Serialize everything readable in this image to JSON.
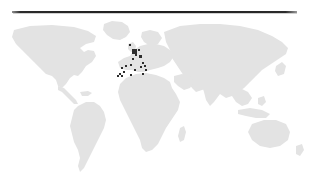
{
  "figure": {
    "background_color": "#ffffff",
    "width": 310,
    "height": 190
  },
  "top_rule": {
    "name": "horizontal-rule",
    "color": "#1d1d1d",
    "x": 12,
    "y": 11,
    "width": 285,
    "thickness": 2
  },
  "map": {
    "projection": "equirectangular",
    "land_color": "#e3e3e3",
    "ocean_color": "#ffffff",
    "x": 0,
    "y": 18,
    "width": 310,
    "height": 162,
    "continents": [
      "North America",
      "South America",
      "Europe",
      "Africa",
      "Asia",
      "Australia",
      "Greenland"
    ]
  },
  "chart_data": {
    "type": "scatter",
    "xlabel": "",
    "ylabel": "",
    "marker_color": "#2d2d2d",
    "marker_shape": "square",
    "region_focus": "Western Europe and North Africa",
    "points": [
      {
        "label": "United Kingdom / Ireland",
        "x": 134,
        "y": 33,
        "size": 5
      },
      {
        "label": "Northern Britain",
        "x": 130,
        "y": 27,
        "size": 2
      },
      {
        "label": "Netherlands / Belgium",
        "x": 139,
        "y": 32,
        "size": 2
      },
      {
        "label": "Germany / Central Europe",
        "x": 140,
        "y": 38,
        "size": 3
      },
      {
        "label": "Northern France",
        "x": 136,
        "y": 37,
        "size": 2
      },
      {
        "label": "Western France",
        "x": 133,
        "y": 41,
        "size": 2
      },
      {
        "label": "Northern Spain",
        "x": 131,
        "y": 47,
        "size": 2
      },
      {
        "label": "Central Iberia",
        "x": 126,
        "y": 48,
        "size": 2
      },
      {
        "label": "Portugal",
        "x": 122,
        "y": 50,
        "size": 2
      },
      {
        "label": "Southern Spain",
        "x": 124,
        "y": 54,
        "size": 2
      },
      {
        "label": "Gibraltar / Morocco",
        "x": 122,
        "y": 58,
        "size": 2
      },
      {
        "label": "Morocco Atlantic coast",
        "x": 120,
        "y": 56,
        "size": 2
      },
      {
        "label": "Canary Islands",
        "x": 118,
        "y": 58,
        "size": 2
      },
      {
        "label": "Northern Italy",
        "x": 143,
        "y": 45,
        "size": 2
      },
      {
        "label": "Central Italy",
        "x": 145,
        "y": 48,
        "size": 2
      },
      {
        "label": "Corsica / Sardinia",
        "x": 141,
        "y": 49,
        "size": 2
      },
      {
        "label": "Southern Italy",
        "x": 146,
        "y": 52,
        "size": 2
      },
      {
        "label": "Western Mediterranean",
        "x": 135,
        "y": 52,
        "size": 2
      },
      {
        "label": "Algeria coast",
        "x": 131,
        "y": 57,
        "size": 2
      },
      {
        "label": "Tunisia",
        "x": 143,
        "y": 56,
        "size": 2
      }
    ]
  }
}
